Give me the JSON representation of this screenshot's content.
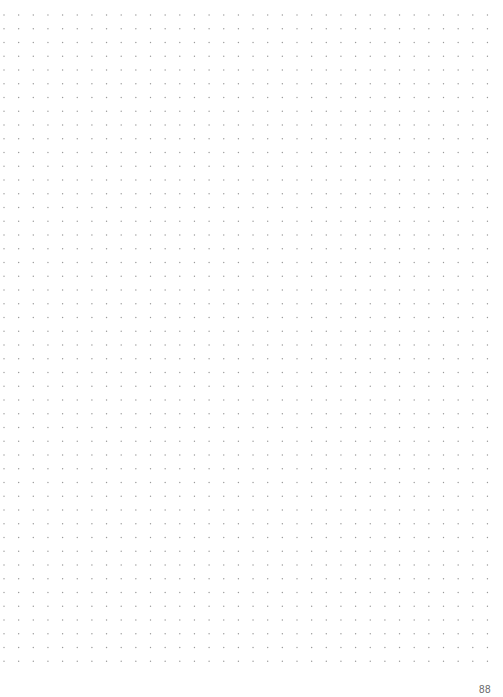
{
  "page": {
    "type": "dot-grid notebook page",
    "page_number": "88",
    "dot_color": "#9a9a9a",
    "background": "#ffffff",
    "grid": {
      "columns": 34,
      "rows": 48,
      "start_x": 4,
      "start_y": 15,
      "spacing_x": 14.65,
      "spacing_y": 13.75,
      "dot_radius": 0.7
    }
  }
}
